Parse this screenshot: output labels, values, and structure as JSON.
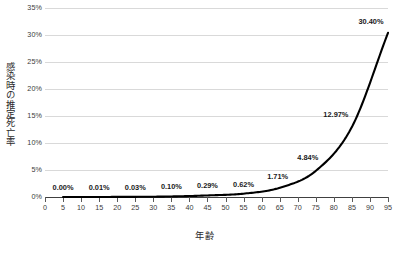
{
  "chart_data": {
    "type": "line",
    "title": "",
    "xlabel": "年齢",
    "ylabel": "感染時の推定死亡率",
    "xlim": [
      0,
      95
    ],
    "ylim": [
      0,
      35
    ],
    "grid": true,
    "legend": "none",
    "line_color": "#000000",
    "gridline_color": "#d9d9d9",
    "axis_color": "#404040",
    "x_tick_labels": [
      "0",
      "5",
      "10",
      "15",
      "20",
      "25",
      "30",
      "35",
      "40",
      "45",
      "50",
      "55",
      "60",
      "65",
      "70",
      "75",
      "80",
      "85",
      "90",
      "95"
    ],
    "x_tick_values": [
      0,
      5,
      10,
      15,
      20,
      25,
      30,
      35,
      40,
      45,
      50,
      55,
      60,
      65,
      70,
      75,
      80,
      85,
      90,
      95
    ],
    "y_tick_labels": [
      "0%",
      "5%",
      "10%",
      "15%",
      "20%",
      "25%",
      "30%",
      "35%"
    ],
    "y_tick_values": [
      0,
      5,
      10,
      15,
      20,
      25,
      30,
      35
    ],
    "x": [
      5,
      15,
      25,
      35,
      45,
      55,
      65,
      75,
      85,
      95
    ],
    "values": [
      0.0,
      0.01,
      0.03,
      0.1,
      0.29,
      0.62,
      1.71,
      4.84,
      12.97,
      30.4
    ],
    "point_labels": [
      "0.00%",
      "0.01%",
      "0.03%",
      "0.10%",
      "0.29%",
      "0.62%",
      "1.71%",
      "4.84%",
      "12.97%",
      "30.40%"
    ],
    "series": [
      {
        "name": "感染時の推定死亡率",
        "x": [
          5,
          15,
          25,
          35,
          45,
          55,
          65,
          75,
          85,
          95
        ],
        "values": [
          0.0,
          0.01,
          0.03,
          0.1,
          0.29,
          0.62,
          1.71,
          4.84,
          12.97,
          30.4
        ]
      }
    ]
  }
}
